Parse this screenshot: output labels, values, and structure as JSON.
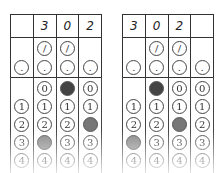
{
  "grids": [
    {
      "name": "left",
      "header": [
        "",
        "3",
        "0",
        "2"
      ],
      "columns": [
        {
          "slash": false,
          "dot": ".",
          "digits": [
            "",
            "1",
            "2",
            "3",
            "4"
          ],
          "filled": null
        },
        {
          "slash": "/",
          "dot": ".",
          "digits": [
            "0",
            "1",
            "2",
            "3",
            "4"
          ],
          "filled": "3"
        },
        {
          "slash": "/",
          "dot": ".",
          "digits": [
            "0",
            "1",
            "2",
            "3",
            "4"
          ],
          "filled": "0"
        },
        {
          "slash": false,
          "dot": ".",
          "digits": [
            "0",
            "1",
            "2",
            "3",
            "4"
          ],
          "filled": "2"
        }
      ]
    },
    {
      "name": "right",
      "header": [
        "3",
        "0",
        "2",
        ""
      ],
      "columns": [
        {
          "slash": false,
          "dot": ".",
          "digits": [
            "",
            "1",
            "2",
            "3",
            "4"
          ],
          "filled": "3"
        },
        {
          "slash": "/",
          "dot": ".",
          "digits": [
            "0",
            "1",
            "2",
            "3",
            "4"
          ],
          "filled": "0"
        },
        {
          "slash": "/",
          "dot": ".",
          "digits": [
            "0",
            "1",
            "2",
            "3",
            "4"
          ],
          "filled": "2"
        },
        {
          "slash": false,
          "dot": ".",
          "digits": [
            "0",
            "1",
            "2",
            "3",
            "4"
          ],
          "filled": null
        }
      ]
    }
  ]
}
